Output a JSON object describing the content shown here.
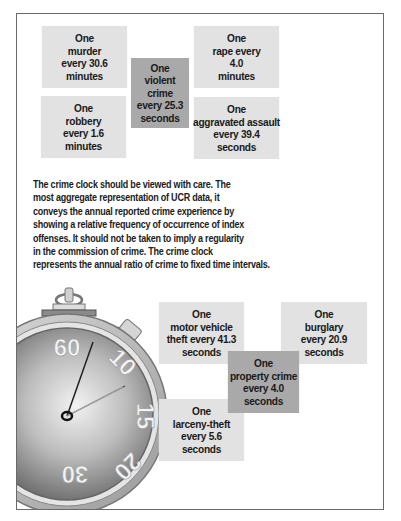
{
  "violent_clock": {
    "center": {
      "lines": [
        "One",
        "violent",
        "crime",
        "every 25.3",
        "seconds"
      ],
      "color": "#a9a9a9"
    },
    "murder": {
      "lines": [
        "One",
        "murder",
        "every 30.6",
        "minutes"
      ],
      "color": "#e2e2e2"
    },
    "rape": {
      "lines": [
        "One",
        "rape every",
        "4.0",
        "minutes"
      ],
      "color": "#e2e2e2"
    },
    "robbery": {
      "lines": [
        "One",
        "robbery",
        "every 1.6",
        "minutes"
      ],
      "color": "#e2e2e2"
    },
    "aggravated_assault": {
      "lines": [
        "One",
        "aggravated assault",
        "every 39.4",
        "seconds"
      ],
      "color": "#e2e2e2"
    }
  },
  "description": {
    "lines": [
      "The crime clock should be viewed with care. The",
      "most aggregate representation of UCR data, it",
      "conveys the annual reported crime experience by",
      "showing a relative frequency of occurrence of index",
      "offenses. It should not be taken to imply a regularity",
      "in the commission of crime. The crime clock",
      "represents the annual ratio of crime to fixed time intervals."
    ]
  },
  "stopwatch": {
    "icon": "stopwatch-icon",
    "dial_numbers": [
      "60",
      "10",
      "15",
      "20",
      "30"
    ]
  },
  "property_clock": {
    "center": {
      "lines": [
        "One",
        "property crime",
        "every 4.0",
        "seconds"
      ],
      "color": "#a9a9a9"
    },
    "motor_vehicle_theft": {
      "lines": [
        "One",
        "motor vehicle",
        "theft every 41.3",
        "seconds"
      ],
      "color": "#e2e2e2"
    },
    "burglary": {
      "lines": [
        "One",
        "burglary",
        "every 20.9",
        "seconds"
      ],
      "color": "#e2e2e2"
    },
    "larceny_theft": {
      "lines": [
        "One",
        "larceny-theft",
        "every 5.6",
        "seconds"
      ],
      "color": "#e2e2e2"
    }
  }
}
